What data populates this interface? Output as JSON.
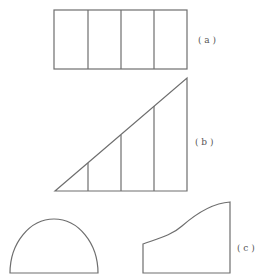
{
  "figures": {
    "a": {
      "label": "( a )",
      "divisions": 4
    },
    "b": {
      "label": "( b )",
      "divisions": 4
    },
    "c": {
      "label": "( c )"
    }
  },
  "colors": {
    "stroke": "#6e6e6e",
    "text": "#555555",
    "background": "#ffffff"
  }
}
